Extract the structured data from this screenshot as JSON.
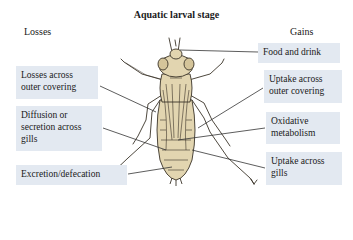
{
  "title": "Aquatic larval stage",
  "columns": {
    "losses": "Losses",
    "gains": "Gains"
  },
  "losses": [
    {
      "label": "Losses across outer covering"
    },
    {
      "label": "Diffusion or secretion across gills"
    },
    {
      "label": "Excretion/defecation"
    }
  ],
  "gains": [
    {
      "label": "Food and drink"
    },
    {
      "label": "Uptake across outer covering"
    },
    {
      "label": "Oxidative metabolism"
    },
    {
      "label": "Uptake across gills"
    }
  ],
  "colors": {
    "box_fill": "#e3e9f1",
    "body_fill": "#e2d5b0",
    "outline": "#3a3328",
    "leader_line": "#333333"
  }
}
